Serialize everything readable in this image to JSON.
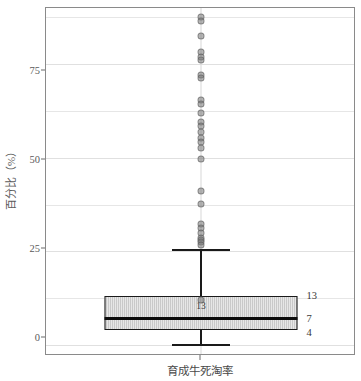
{
  "chart_data": {
    "type": "box",
    "title": "",
    "xlabel": "育成牛死淘率",
    "ylabel": "百分比（%）",
    "ylim": [
      -3,
      90
    ],
    "yticks": [
      0,
      25,
      50,
      75
    ],
    "ytick_labels": [
      "0",
      "25",
      "50",
      "75"
    ],
    "grid": true,
    "grid_minor_step": 12.5,
    "gridlines": [
      0,
      12.5,
      25,
      37.5,
      50,
      62.5,
      75,
      87.5
    ],
    "categories": [
      "育成牛死淘率"
    ],
    "boxes": [
      {
        "category": "育成牛死淘率",
        "q1": 4,
        "median": 7,
        "q3": 13,
        "whisker_low": 0.3,
        "whisker_high": 25.5,
        "inner_label": "13",
        "outliers": [
          87.5,
          86.6,
          82.5,
          78.2,
          77.0,
          76.2,
          72.0,
          71.4,
          65.3,
          64.4,
          62.0,
          59.5,
          58.6,
          56.8,
          55.4,
          54.2,
          52.6,
          49.7,
          41.0,
          37.6,
          32.4,
          31.2,
          29.8,
          28.6,
          28.0,
          27.4,
          26.8,
          12.0
        ]
      }
    ],
    "annotations": {
      "q3_label": "13",
      "median_label": "7",
      "q1_label": "4"
    },
    "colors": {
      "box_fill": "#c9c9c9",
      "box_edge": "#1a1a1a",
      "median": "#0d0d0d",
      "outlier": "#787878",
      "grid": "#e6e6e6",
      "panel_border": "#8a8a8a",
      "text": "#4a4a4a"
    }
  },
  "axis": {
    "y_label": "百分比（%）",
    "x_label": "育成牛死淘率",
    "ytick_0": "0",
    "ytick_25": "25",
    "ytick_50": "50",
    "ytick_75": "75"
  },
  "stats": {
    "q3": "13",
    "median": "7",
    "q1": "4",
    "box_inner": "13"
  }
}
